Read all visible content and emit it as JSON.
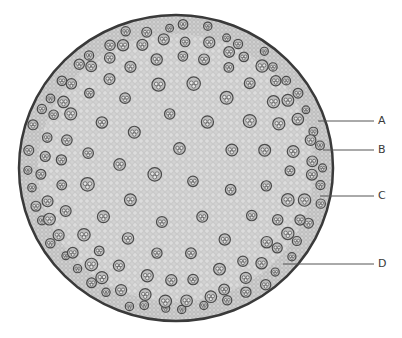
{
  "figure": {
    "colors": {
      "ground_tissue": "#cfcfcf",
      "epidermis": "#3a3a3a",
      "bundle": "#5a5a5a",
      "leader_line": "#555555",
      "label_text": "#3a3a3a"
    },
    "labels": [
      {
        "id": "A",
        "text": "A",
        "line": {
          "x1": 318,
          "y1": 121,
          "x2": 374,
          "y2": 121
        },
        "text_pos": {
          "x": 378,
          "y": 115
        }
      },
      {
        "id": "B",
        "text": "B",
        "line": {
          "x1": 323,
          "y1": 150,
          "x2": 374,
          "y2": 150
        },
        "text_pos": {
          "x": 378,
          "y": 144
        }
      },
      {
        "id": "C",
        "text": "C",
        "line": {
          "x1": 320,
          "y1": 196,
          "x2": 374,
          "y2": 196
        },
        "text_pos": {
          "x": 378,
          "y": 190
        }
      },
      {
        "id": "D",
        "text": "D",
        "line": {
          "x1": 283,
          "y1": 264,
          "x2": 374,
          "y2": 264
        },
        "text_pos": {
          "x": 378,
          "y": 258
        }
      }
    ]
  }
}
